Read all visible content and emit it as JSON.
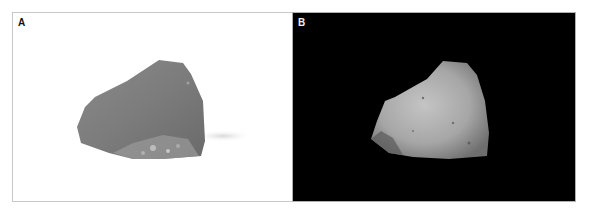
{
  "figure": {
    "panels": [
      {
        "label": "A",
        "background": "#ffffff",
        "description": "Rock fragment photographed on white background"
      },
      {
        "label": "B",
        "background": "#000000",
        "description": "Same rock fragment photographed on black background, illuminated"
      }
    ]
  }
}
